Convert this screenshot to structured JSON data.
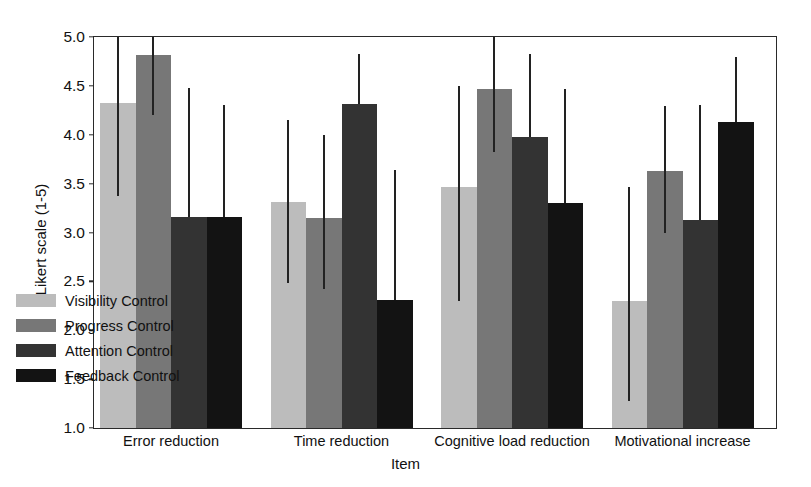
{
  "chart_data": {
    "type": "bar",
    "title": "",
    "xlabel": "Item",
    "ylabel": "Likert scale (1-5)",
    "ylim": [
      1.0,
      5.0
    ],
    "yticks": [
      "1.0",
      "1.5",
      "2.0",
      "2.5",
      "3.0",
      "3.5",
      "4.0",
      "4.5",
      "5.0"
    ],
    "ytick_values": [
      1.0,
      1.5,
      2.0,
      2.5,
      3.0,
      3.5,
      4.0,
      4.5,
      5.0
    ],
    "grid": false,
    "legend_position": "lower left (inside axes)",
    "error_bars": "vertical lines, no caps",
    "categories": [
      "Error reduction",
      "Time reduction",
      "Cognitive load reduction",
      "Motivational increase"
    ],
    "series": [
      {
        "name": "Visibility Control",
        "color": "#bcbcbc",
        "values": [
          4.32,
          3.31,
          3.47,
          2.3
        ],
        "err_low": [
          3.37,
          2.48,
          2.3,
          1.28
        ],
        "err_high": [
          5.0,
          4.15,
          4.5,
          3.47
        ]
      },
      {
        "name": "Progress Control",
        "color": "#777777",
        "values": [
          4.82,
          3.15,
          4.47,
          3.63
        ],
        "err_low": [
          4.2,
          2.42,
          3.82,
          2.99
        ],
        "err_high": [
          5.0,
          4.0,
          5.0,
          4.29
        ]
      },
      {
        "name": "Attention Control",
        "color": "#333333",
        "values": [
          3.16,
          4.31,
          3.98,
          3.13
        ],
        "err_low": [
          3.16,
          4.31,
          3.98,
          3.13
        ],
        "err_high": [
          4.48,
          4.83,
          4.83,
          4.3
        ]
      },
      {
        "name": "Feedback Control",
        "color": "#131313",
        "values": [
          3.16,
          2.31,
          3.3,
          4.13
        ],
        "err_low": [
          3.16,
          2.31,
          3.3,
          4.13
        ],
        "err_high": [
          4.3,
          3.64,
          4.47,
          4.8
        ]
      }
    ]
  },
  "legend": {
    "items": [
      {
        "label": "Visibility Control",
        "color": "#bcbcbc"
      },
      {
        "label": "Progress Control",
        "color": "#777777"
      },
      {
        "label": "Attention Control",
        "color": "#333333"
      },
      {
        "label": "Feedback Control",
        "color": "#131313"
      }
    ]
  },
  "axes": {
    "ylabel": "Likert scale (1-5)",
    "xlabel": "Item"
  }
}
